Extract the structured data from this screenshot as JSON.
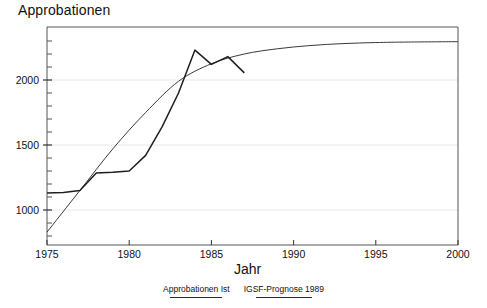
{
  "figure": {
    "y_axis_title": "Approbationen",
    "x_axis_title": "Jahr"
  },
  "legend": {
    "items": [
      {
        "label": "Approbationen Ist",
        "key": "ist"
      },
      {
        "label": "IGSF-Prognose 1989",
        "key": "prognose"
      }
    ]
  },
  "axes": {
    "x_ticks": [
      "1975",
      "1980",
      "1985",
      "1990",
      "1995",
      "2000"
    ],
    "y_ticks": [
      "1000",
      "1500",
      "2000"
    ]
  },
  "colors": {
    "ist_line": "#1f1f1f",
    "prognose_line": "#3a3a3a",
    "grid": "#e6e6e6",
    "axis": "#4a4a4a",
    "text": "#111111",
    "background": "#ffffff"
  },
  "chart_data": {
    "type": "line",
    "title": "",
    "xlabel": "Jahr",
    "ylabel": "Approbationen",
    "xlim": [
      1975,
      2000
    ],
    "ylim": [
      700,
      2400
    ],
    "grid": true,
    "grid_axis": "y",
    "legend_position": "bottom-center",
    "x_ticks": [
      1975,
      1980,
      1985,
      1990,
      1995,
      2000
    ],
    "y_ticks": [
      1000,
      1500,
      2000
    ],
    "y_minor_tick_step": 100,
    "series": [
      {
        "name": "Approbationen Ist",
        "x": [
          1975,
          1976,
          1977,
          1978,
          1979,
          1980,
          1981,
          1982,
          1983,
          1984,
          1985,
          1986,
          1987
        ],
        "values": [
          1130,
          1135,
          1150,
          1285,
          1290,
          1300,
          1420,
          1640,
          1900,
          2230,
          2120,
          2180,
          2055
        ]
      },
      {
        "name": "IGSF-Prognose 1989",
        "x": [
          1975,
          1977,
          1979,
          1981,
          1983,
          1985,
          1987,
          1989,
          1991,
          1993,
          1995,
          1997,
          2000
        ],
        "values": [
          830,
          1150,
          1470,
          1750,
          1990,
          2125,
          2200,
          2240,
          2265,
          2280,
          2288,
          2292,
          2295
        ]
      }
    ]
  }
}
